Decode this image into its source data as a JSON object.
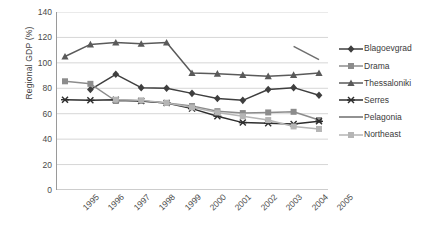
{
  "chart_data": {
    "type": "line",
    "title": "",
    "xlabel": "",
    "ylabel": "Regional GDP (%)",
    "categories": [
      "1995",
      "1996",
      "1997",
      "1998",
      "1999",
      "2000",
      "2001",
      "2002",
      "2003",
      "2004",
      "2005"
    ],
    "ylim": [
      0,
      140
    ],
    "ytick_step": 20,
    "yticks": [
      "0",
      "20",
      "40",
      "60",
      "80",
      "100",
      "120",
      "140"
    ],
    "grid": "horizontal",
    "legend_position": "right",
    "series": [
      {
        "name": "Blagoevgrad",
        "marker": "diamond",
        "color": "#3f3f3f",
        "values": [
          null,
          79.0,
          91.0,
          80.5,
          80.0,
          76.0,
          72.0,
          70.5,
          79.0,
          80.5,
          74.5
        ]
      },
      {
        "name": "Drama",
        "marker": "square",
        "color": "#8c8c8c",
        "values": [
          85.5,
          83.5,
          70.0,
          70.0,
          68.5,
          66.0,
          62.0,
          60.5,
          61.0,
          61.5,
          55.0
        ]
      },
      {
        "name": "Thessaloniki",
        "marker": "triangle",
        "color": "#5a5a5a",
        "values": [
          105.0,
          114.5,
          116.0,
          115.0,
          116.0,
          92.0,
          91.5,
          90.5,
          89.5,
          90.5,
          92.0
        ]
      },
      {
        "name": "Serres",
        "marker": "cross",
        "color": "#2e2e2e",
        "values": [
          71.0,
          70.5,
          71.0,
          70.0,
          68.5,
          64.0,
          58.0,
          53.0,
          52.5,
          52.0,
          54.0
        ]
      },
      {
        "name": "Pelagonia",
        "marker": "none",
        "color": "#6e6e6e",
        "values": [
          null,
          null,
          null,
          null,
          null,
          null,
          null,
          null,
          null,
          113.0,
          102.5
        ]
      },
      {
        "name": "Northeast",
        "marker": "square",
        "color": "#b5b5b5",
        "values": [
          null,
          null,
          71.0,
          70.5,
          68.5,
          65.0,
          61.0,
          58.0,
          55.0,
          50.0,
          48.0
        ]
      }
    ]
  },
  "legend": {
    "items": [
      {
        "label": "Blagoevgrad"
      },
      {
        "label": "Drama"
      },
      {
        "label": "Thessaloniki"
      },
      {
        "label": "Serres"
      },
      {
        "label": "Pelagonia"
      },
      {
        "label": "Northeast"
      }
    ]
  },
  "colors": {
    "grid": "#d6d6d6",
    "axis": "#9a9a9a",
    "text": "#4a4a4a",
    "background": "#ffffff"
  }
}
